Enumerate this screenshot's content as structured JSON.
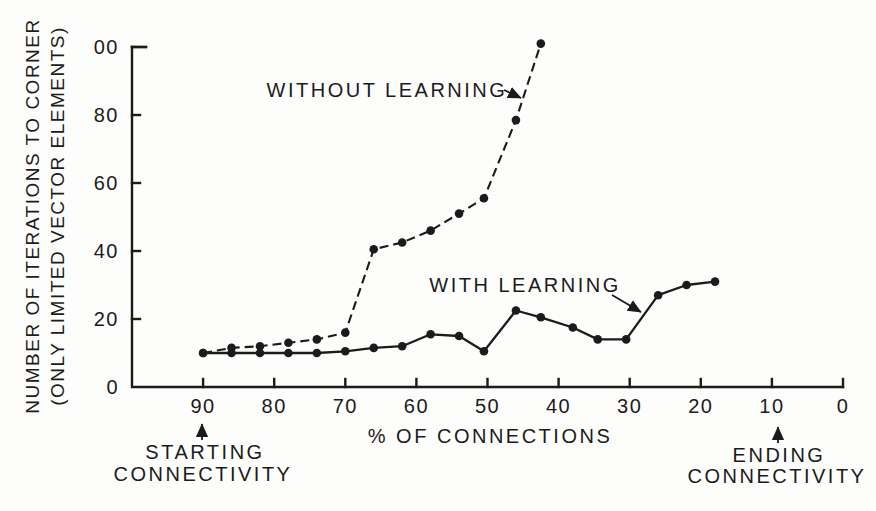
{
  "figure": {
    "background": "#fdfdfc",
    "ink_color": "#1b1b1b"
  },
  "chart_data": {
    "type": "line",
    "title": "",
    "xlabel": "% OF CONNECTIONS",
    "ylabel_line1": "NUMBER OF ITERATIONS TO CORNER",
    "ylabel_line2": "(ONLY LIMITED VECTOR ELEMENTS)",
    "x_axis": {
      "min": 0,
      "max": 100,
      "reversed": true,
      "ticks": [
        90,
        80,
        70,
        60,
        50,
        40,
        30,
        20,
        10,
        0
      ],
      "tick_labels": [
        "90",
        "80",
        "70",
        "60",
        "50",
        "40",
        "30",
        "20",
        "10",
        "0"
      ]
    },
    "y_axis": {
      "min": 0,
      "max": 100,
      "ticks": [
        0,
        20,
        40,
        60,
        80,
        100
      ],
      "tick_labels": [
        "0",
        "20",
        "40",
        "60",
        "80",
        "00"
      ]
    },
    "grid": "off",
    "series": [
      {
        "name": "WITHOUT LEARNING",
        "line_style": "dashed",
        "marker": "filled-circle",
        "points": [
          [
            90,
            10
          ],
          [
            86,
            11.5
          ],
          [
            82,
            12
          ],
          [
            78,
            13
          ],
          [
            74,
            14
          ],
          [
            70,
            16
          ],
          [
            66,
            40.5
          ],
          [
            62,
            42.5
          ],
          [
            58,
            46
          ],
          [
            54,
            51
          ],
          [
            50.5,
            55.5
          ],
          [
            46,
            78.5
          ],
          [
            42.5,
            101
          ]
        ]
      },
      {
        "name": "WITH LEARNING",
        "line_style": "solid",
        "marker": "filled-circle",
        "points": [
          [
            90,
            10
          ],
          [
            86,
            10
          ],
          [
            82,
            10
          ],
          [
            78,
            10
          ],
          [
            74,
            10
          ],
          [
            70,
            10.5
          ],
          [
            66,
            11.5
          ],
          [
            62,
            12
          ],
          [
            58,
            15.5
          ],
          [
            54,
            15
          ],
          [
            50.5,
            10.5
          ],
          [
            46,
            22.5
          ],
          [
            42.5,
            20.5
          ],
          [
            38,
            17.5
          ],
          [
            34.5,
            14
          ],
          [
            30.5,
            14
          ],
          [
            26,
            27
          ],
          [
            22,
            30
          ],
          [
            18,
            31
          ]
        ]
      }
    ],
    "series_labels": [
      {
        "text": "WITHOUT LEARNING",
        "points_to_series": "WITHOUT LEARNING"
      },
      {
        "text": "WITH LEARNING",
        "points_to_series": "WITH LEARNING"
      }
    ],
    "annotations": [
      {
        "line1": "STARTING",
        "line2": "CONNECTIVITY",
        "at_x_value": 90,
        "arrow_direction": "up"
      },
      {
        "line1": "ENDING",
        "line2": "CONNECTIVITY",
        "at_x_value": 10,
        "arrow_direction": "up"
      }
    ]
  }
}
